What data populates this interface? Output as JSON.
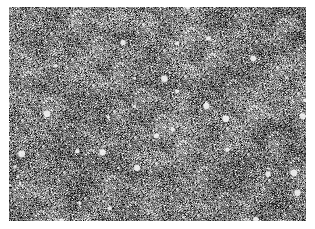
{
  "image": {
    "kind": "grayscale-noise-texture",
    "description": "Granular grayscale micrograph-like texture with scattered bright specks",
    "region": {
      "x": 9,
      "y": 7,
      "width": 297,
      "height": 214
    },
    "background_color": "#ffffff",
    "tone": {
      "mean_gray": "#7a7a7a",
      "dark": "#111111",
      "light": "#f2f2f2"
    }
  }
}
